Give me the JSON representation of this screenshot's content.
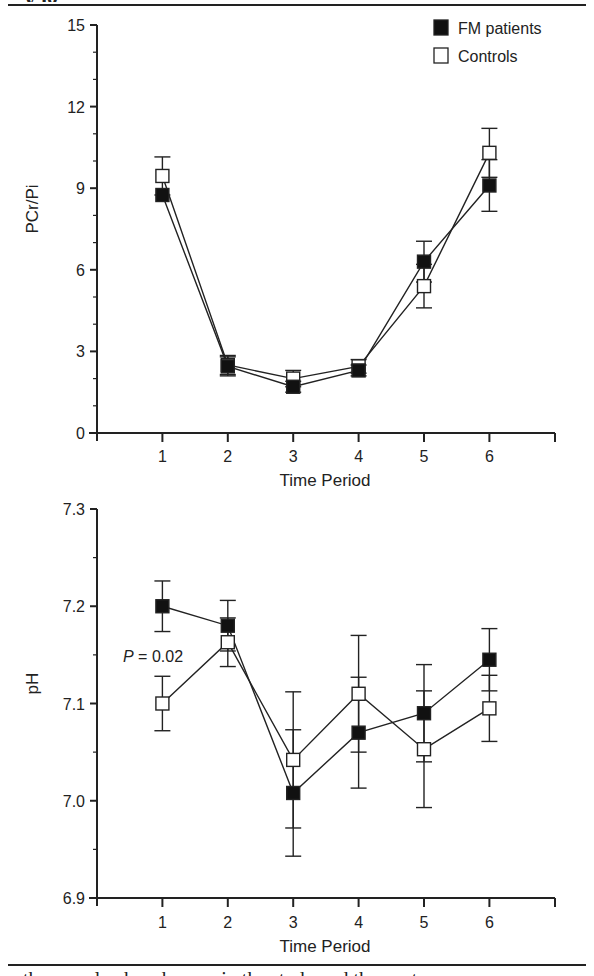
{
  "header": {
    "cut_text": "...y ig...",
    "rule": true
  },
  "footer": {
    "cut_text": "...the muscle phosphorous in the study and the cont..."
  },
  "legend": {
    "items": [
      {
        "label": "FM patients",
        "marker": "filled-square",
        "color": "#111111"
      },
      {
        "label": "Controls",
        "marker": "open-square",
        "color": "#ffffff"
      }
    ]
  },
  "annotation": {
    "p_label": "P",
    "p_value": " = 0.02"
  },
  "chart_data": [
    {
      "type": "line",
      "title": "",
      "xlabel": "Time Period",
      "ylabel": "PCr/Pi",
      "x": [
        1,
        2,
        3,
        4,
        5,
        6
      ],
      "xlim": [
        0,
        7
      ],
      "ylim": [
        0,
        15
      ],
      "yticks": [
        0,
        3,
        6,
        9,
        12,
        15
      ],
      "grid": false,
      "legend_position": "top-right",
      "series": [
        {
          "name": "FM patients",
          "marker": "filled-square",
          "values": [
            8.75,
            2.45,
            1.7,
            2.3,
            6.3,
            9.1
          ],
          "error": [
            0.0,
            0.35,
            0.2,
            0.2,
            0.75,
            0.95
          ]
        },
        {
          "name": "Controls",
          "marker": "open-square",
          "values": [
            9.45,
            2.5,
            2.0,
            2.45,
            5.4,
            10.3
          ],
          "error": [
            0.7,
            0.35,
            0.3,
            0.25,
            0.8,
            0.9
          ]
        }
      ]
    },
    {
      "type": "line",
      "title": "",
      "xlabel": "Time Period",
      "ylabel": "pH",
      "x": [
        1,
        2,
        3,
        4,
        5,
        6
      ],
      "xlim": [
        0,
        7
      ],
      "ylim": [
        6.9,
        7.3
      ],
      "yticks": [
        "6.9",
        "7.0",
        "7.1",
        "7.2",
        "7.3"
      ],
      "grid": false,
      "annotations": [
        "P = 0.02 (at time period 1)"
      ],
      "series": [
        {
          "name": "FM patients",
          "marker": "filled-square",
          "values": [
            7.2,
            7.18,
            7.008,
            7.07,
            7.09,
            7.145
          ],
          "error": [
            0.026,
            0.026,
            0.065,
            0.057,
            0.05,
            0.032
          ]
        },
        {
          "name": "Controls",
          "marker": "open-square",
          "values": [
            7.1,
            7.163,
            7.042,
            7.11,
            7.053,
            7.095
          ],
          "error": [
            0.028,
            0.025,
            0.07,
            0.06,
            0.06,
            0.034
          ]
        }
      ]
    }
  ]
}
